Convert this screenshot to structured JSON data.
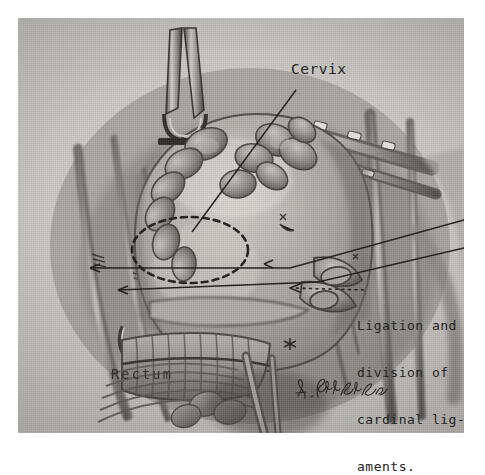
{
  "figure": {
    "kind": "anatomical-surgical-illustration",
    "medium": "pencil and charcoal drawing",
    "page_background": "#ffffff",
    "plate_background": "#c9c7c3",
    "ink_color": "#232323"
  },
  "annotations": {
    "cervix": {
      "label": "Cervix",
      "leader": "line from label down-left to dashed ellipse over cervix"
    },
    "rectum": {
      "label": "Rectum"
    },
    "ligation": {
      "line1": "Ligation and",
      "line2": "division of",
      "line3": "cardinal lig-",
      "line4": "aments.",
      "leader": "two solid lines plus one dotted arrow pointing left into the operative field"
    }
  },
  "signature": {
    "text": "L. Schlossberg",
    "style": "cursive artist signature, lower right of plate"
  },
  "markers": {
    "cervix_ellipse": "dashed ellipse outlining the cervix",
    "arrowheads": 3
  }
}
